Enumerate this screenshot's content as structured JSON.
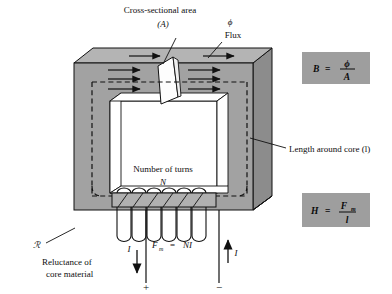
{
  "figure": {
    "type": "technical-illustration"
  },
  "labels": {
    "cross_section_line1": "Cross-sectional area",
    "cross_section_line2": "(A)",
    "flux_symbol": "ϕ",
    "flux_word": "Flux",
    "length_around_core": "Length around core (l)",
    "number_of_turns_line1": "Number of turns",
    "number_of_turns_line2": "N",
    "reluctance_symbol": "ℛ",
    "reluctance_line1": "Reluctance of",
    "reluctance_line2": "core material",
    "mmf_equation": "Fₘ = NI",
    "mmf_F": "F",
    "mmf_sub": "m",
    "mmf_eq": "=",
    "mmf_NI": "NI",
    "current_left": "I",
    "current_right": "I",
    "terminal_positive": "+",
    "terminal_negative": "−"
  },
  "formula_boxes": [
    {
      "name": "flux-density-formula",
      "lhs": "B",
      "equals": "=",
      "numerator": "ϕ",
      "denominator": "A",
      "plain": "B = ϕ / A",
      "bg_color": "#9e9e9e"
    },
    {
      "name": "field-intensity-formula",
      "lhs": "H",
      "equals": "=",
      "numerator": "F",
      "numerator_sub": "m",
      "denominator": "l",
      "plain": "H = Fₘ / l",
      "bg_color": "#9e9e9e"
    }
  ],
  "core": {
    "front_face_color": "#a2a2a2",
    "top_face_color": "#b4b4b4",
    "side_face_color": "#8c8c8c",
    "window_color": "#ffffff",
    "cross_section_color": "#fdfdfd",
    "outline_color": "#111111",
    "coil_turns": 6,
    "flux_arrow_count": 8,
    "flux_path_style": "dashed"
  },
  "colors": {
    "background": "#ffffff",
    "ink": "#101010"
  }
}
